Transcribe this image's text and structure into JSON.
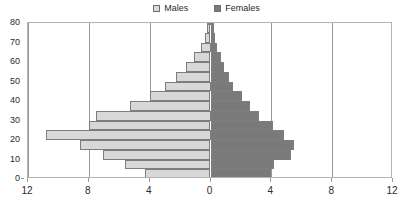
{
  "legend": {
    "entries": [
      {
        "label": "Males",
        "color": "#d8d8d8",
        "icon": "legend-swatch-males"
      },
      {
        "label": "Females",
        "color": "#7a7a7a",
        "icon": "legend-swatch-females"
      }
    ]
  },
  "chart_data": {
    "type": "bar",
    "subtype": "population-pyramid",
    "title": "",
    "xlabel": "",
    "ylabel": "",
    "orientation": "horizontal",
    "grid": true,
    "legend_position": "top-center",
    "xlim": [
      -12,
      12
    ],
    "ylim": [
      0,
      80
    ],
    "x_tick_values": [
      -12,
      -8,
      -4,
      0,
      4,
      8,
      12
    ],
    "x_tick_labels": [
      "12",
      "8",
      "4",
      "0",
      "4",
      "8",
      "12"
    ],
    "y_tick_values": [
      0,
      10,
      20,
      30,
      40,
      50,
      60,
      70,
      80
    ],
    "y_tick_labels": [
      "0",
      "10",
      "20",
      "30",
      "40",
      "50",
      "60",
      "70",
      "80"
    ],
    "categories": [
      "0-4",
      "5-9",
      "10-14",
      "15-19",
      "20-24",
      "25-29",
      "30-34",
      "35-39",
      "40-44",
      "45-49",
      "50-54",
      "55-59",
      "60-64",
      "65-69",
      "70-74",
      "75-79",
      "80+"
    ],
    "category_starts": [
      0,
      5,
      10,
      15,
      20,
      25,
      30,
      35,
      40,
      45,
      50,
      55,
      60,
      65,
      70,
      75,
      80
    ],
    "series": [
      {
        "name": "Males",
        "color": "#d8d8d8",
        "values": [
          4.3,
          5.6,
          7.1,
          8.6,
          10.8,
          8.0,
          7.5,
          5.3,
          4.0,
          3.0,
          2.3,
          1.6,
          1.1,
          0.6,
          0.35,
          0.25,
          0.15
        ]
      },
      {
        "name": "Females",
        "color": "#7a7a7a",
        "values": [
          4.0,
          4.2,
          5.3,
          5.5,
          4.8,
          4.1,
          3.2,
          2.6,
          2.1,
          1.5,
          1.2,
          0.9,
          0.7,
          0.4,
          0.3,
          0.2,
          0.12
        ]
      }
    ]
  }
}
